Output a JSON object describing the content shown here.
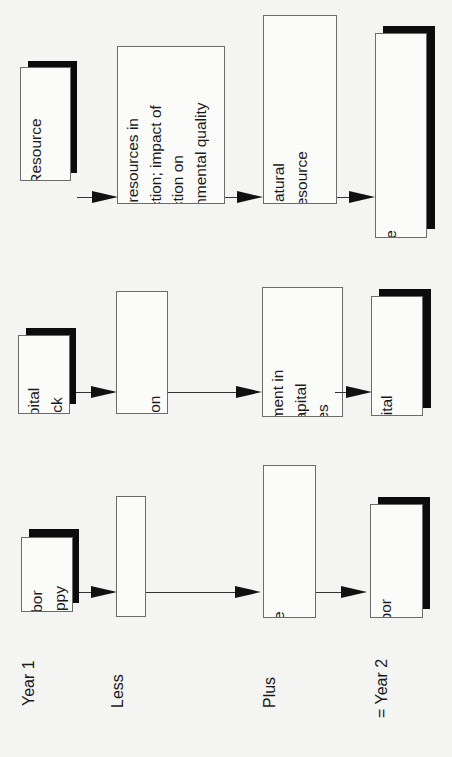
{
  "diagram": {
    "row_labels": {
      "year1": "Year 1",
      "less": "Less",
      "plus": "Plus",
      "year2": "= Year 2"
    },
    "natural_resources": {
      "start": "Natural Resource\nBase",
      "less": "use of resources in\nproduction; impact of\nproduction on\nenvironmental quality",
      "plus": "investments in natural\nresources and resource\nmanagement",
      "end": "New Natural Resource\nBase"
    },
    "capital": {
      "start": "Capital\nStock",
      "less": "capital\ndepreciation",
      "plus": "investment in\nnew capital\nsupplies",
      "end": "New Capital\nStock"
    },
    "labor": {
      "start": "Labor\nSuppy",
      "less": "retirements",
      "plus": "entries into the\nlabor force",
      "end": "New Labor\nSupply"
    }
  }
}
